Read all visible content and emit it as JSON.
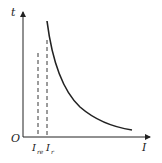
{
  "diagram": {
    "type": "inverse-time curve",
    "axes": {
      "x_label": "I",
      "y_label": "t",
      "origin_label": "O"
    },
    "ticks": [
      {
        "label": "I",
        "subscript": "re"
      },
      {
        "label": "I",
        "subscript": "r"
      }
    ],
    "colors": {
      "line": "#222222",
      "background": "#ffffff"
    }
  }
}
